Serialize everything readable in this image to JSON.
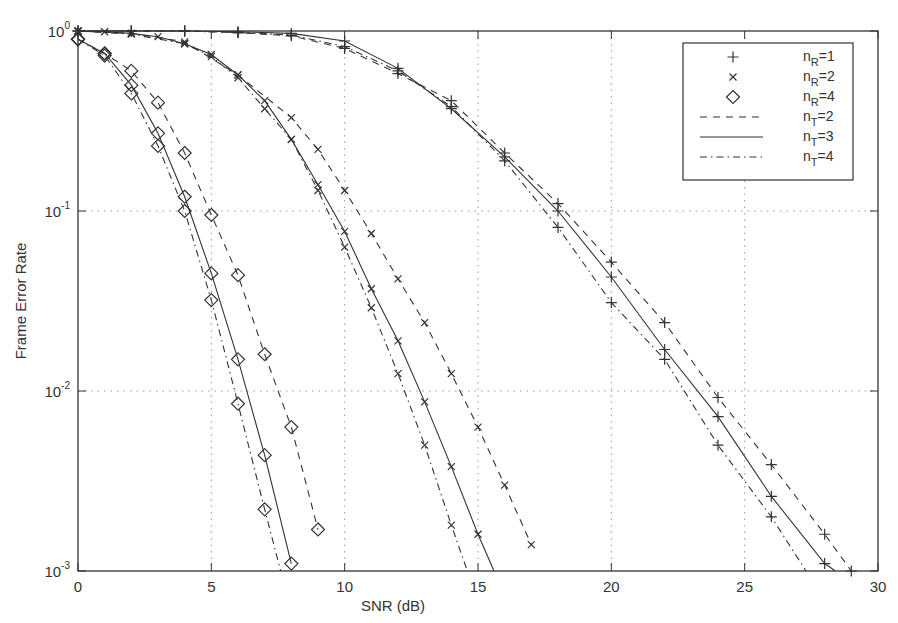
{
  "chart_data": {
    "type": "line",
    "title": "",
    "xlabel": "SNR  (dB)",
    "ylabel": "Frame Error Rate",
    "xlim": [
      0,
      30
    ],
    "ylim": [
      0.001,
      1
    ],
    "yscale": "log",
    "grid": true,
    "legend_position": "upper right",
    "x_ticks": [
      0,
      5,
      10,
      15,
      20,
      25,
      30
    ],
    "y_ticks": [
      {
        "value": 1,
        "base": "10",
        "exp": "0"
      },
      {
        "value": 0.1,
        "base": "10",
        "exp": "-1"
      },
      {
        "value": 0.01,
        "base": "10",
        "exp": "-2"
      },
      {
        "value": 0.001,
        "base": "10",
        "exp": "-3"
      }
    ],
    "legend": [
      {
        "label_main": "n",
        "label_sub": "R",
        "label_rest": "=1",
        "kind": "marker",
        "marker": "plus"
      },
      {
        "label_main": "n",
        "label_sub": "R",
        "label_rest": "=2",
        "kind": "marker",
        "marker": "cross"
      },
      {
        "label_main": "n",
        "label_sub": "R",
        "label_rest": "=4",
        "kind": "marker",
        "marker": "diamond"
      },
      {
        "label_main": "n",
        "label_sub": "T",
        "label_rest": "=2",
        "kind": "line",
        "linestyle": "dashed"
      },
      {
        "label_main": "n",
        "label_sub": "T",
        "label_rest": "=3",
        "kind": "line",
        "linestyle": "solid"
      },
      {
        "label_main": "n",
        "label_sub": "T",
        "label_rest": "=4",
        "kind": "line",
        "linestyle": "dashdot"
      }
    ],
    "series": [
      {
        "name": "nR=4, nT=2",
        "marker": "diamond",
        "linestyle": "dashed",
        "x": [
          0,
          1,
          2,
          3,
          4,
          5,
          6,
          7,
          8,
          9
        ],
        "values": [
          0.9,
          0.75,
          0.6,
          0.4,
          0.21,
          0.095,
          0.044,
          0.016,
          0.0063,
          0.0017
        ]
      },
      {
        "name": "nR=4, nT=3",
        "marker": "diamond",
        "linestyle": "solid",
        "x": [
          0,
          1,
          2,
          3,
          4,
          5,
          6,
          7,
          8
        ],
        "values": [
          0.9,
          0.75,
          0.5,
          0.27,
          0.12,
          0.045,
          0.015,
          0.0044,
          0.0011
        ]
      },
      {
        "name": "nR=4, nT=4",
        "marker": "diamond",
        "linestyle": "dashdot",
        "x": [
          0,
          1,
          2,
          3,
          4,
          5,
          6,
          7,
          7.6
        ],
        "values": [
          0.9,
          0.73,
          0.45,
          0.23,
          0.1,
          0.032,
          0.0085,
          0.0022,
          0.001
        ]
      },
      {
        "name": "nR=2, nT=2",
        "marker": "cross",
        "linestyle": "dashed",
        "x": [
          0,
          2,
          4,
          6,
          8,
          9,
          10,
          11,
          12,
          13,
          14,
          15,
          16,
          17
        ],
        "values": [
          1,
          0.97,
          0.87,
          0.57,
          0.33,
          0.22,
          0.13,
          0.075,
          0.042,
          0.024,
          0.0125,
          0.0063,
          0.003,
          0.0014
        ]
      },
      {
        "name": "nR=2, nT=3",
        "marker": "cross",
        "linestyle": "solid",
        "x": [
          0,
          1,
          2,
          3,
          4,
          5,
          6,
          7,
          8,
          9,
          10,
          11,
          12,
          13,
          14,
          15,
          15.6
        ],
        "values": [
          1,
          0.99,
          0.97,
          0.93,
          0.85,
          0.74,
          0.57,
          0.41,
          0.25,
          0.14,
          0.077,
          0.037,
          0.019,
          0.0087,
          0.0038,
          0.0016,
          0.001
        ]
      },
      {
        "name": "nR=2, nT=4",
        "marker": "cross",
        "linestyle": "dashdot",
        "x": [
          0,
          2,
          4,
          5,
          6,
          7,
          8,
          9,
          10,
          11,
          12,
          13,
          14,
          14.6
        ],
        "values": [
          1,
          0.96,
          0.85,
          0.72,
          0.55,
          0.37,
          0.25,
          0.13,
          0.063,
          0.029,
          0.0125,
          0.005,
          0.0018,
          0.001
        ]
      },
      {
        "name": "nR=1, nT=2",
        "marker": "plus",
        "linestyle": "dashed",
        "x": [
          0,
          2,
          4,
          6,
          8,
          10,
          12,
          14,
          16,
          18,
          20,
          22,
          24,
          26,
          28,
          29
        ],
        "values": [
          1,
          1,
          1,
          0.98,
          0.94,
          0.8,
          0.58,
          0.41,
          0.21,
          0.11,
          0.052,
          0.024,
          0.0092,
          0.0039,
          0.0016,
          0.001
        ]
      },
      {
        "name": "nR=1, nT=3",
        "marker": "plus",
        "linestyle": "solid",
        "x": [
          0,
          2,
          4,
          6,
          8,
          10,
          12,
          14,
          16,
          18,
          20,
          22,
          24,
          26,
          28,
          28.4
        ],
        "values": [
          1,
          1,
          1,
          0.99,
          0.97,
          0.88,
          0.62,
          0.37,
          0.2,
          0.1,
          0.043,
          0.017,
          0.0072,
          0.0026,
          0.0011,
          0.001
        ]
      },
      {
        "name": "nR=1, nT=4",
        "marker": "plus",
        "linestyle": "dashdot",
        "x": [
          0,
          2,
          4,
          6,
          8,
          10,
          12,
          14,
          16,
          18,
          20,
          22,
          24,
          26,
          27.3
        ],
        "values": [
          1,
          1,
          1,
          0.98,
          0.95,
          0.82,
          0.6,
          0.38,
          0.19,
          0.081,
          0.031,
          0.015,
          0.005,
          0.002,
          0.001
        ]
      }
    ]
  },
  "colors": {
    "axis": "#333333",
    "grid": "#999999",
    "line": "#333333",
    "background": "#ffffff"
  }
}
